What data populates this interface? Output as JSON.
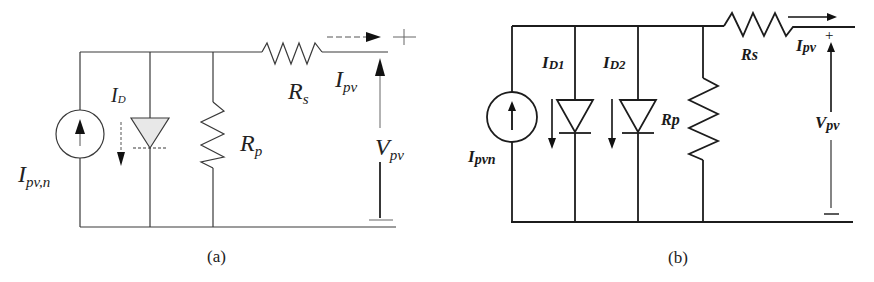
{
  "figure": {
    "panel_a": {
      "caption": "(a)",
      "title": "Single-diode PV model",
      "labels": {
        "source": "I",
        "source_sub": "pv,n",
        "diode_current": "I",
        "diode_current_sub": "D",
        "shunt": "R",
        "shunt_sub": "p",
        "series": "R",
        "series_sub": "s",
        "output_current": "I",
        "output_current_sub": "pv",
        "output_voltage": "V",
        "output_voltage_sub": "pv",
        "plus": "+",
        "minus": "—"
      }
    },
    "panel_b": {
      "caption": "(b)",
      "title": "Double-diode PV model",
      "labels": {
        "source": "I",
        "source_sub": "pvn",
        "diode1_current": "I",
        "diode1_current_sub": "D1",
        "diode2_current": "I",
        "diode2_current_sub": "D2",
        "shunt": "Rp",
        "series": "Rs",
        "output_current": "I",
        "output_current_sub": "pv",
        "output_voltage": "V",
        "output_voltage_sub": "pv",
        "plus": "+",
        "minus": "—"
      }
    }
  }
}
